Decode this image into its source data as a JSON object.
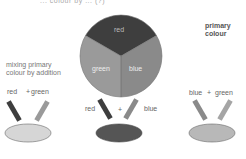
{
  "caption_top": "... colour by ... (?)",
  "wheel": {
    "segments": [
      {
        "label": "red",
        "color": "#3e3e3e"
      },
      {
        "label": "green",
        "color": "#9a9a9a"
      },
      {
        "label": "blue",
        "color": "#8a8a8a"
      }
    ]
  },
  "title_left": "mixing primary colour by addition",
  "title_right": "primary colour",
  "mixes": [
    {
      "label_a": "red",
      "plus": "+",
      "label_b": "green",
      "result_color": "#d4d4d4",
      "bar_a_color": "#3e3e3e",
      "bar_b_color": "#9a9a9a"
    },
    {
      "label_a": "red",
      "plus": "+",
      "label_b": "blue",
      "result_color": "#555555",
      "bar_a_color": "#3e3e3e",
      "bar_b_color": "#8a8a8a"
    },
    {
      "label_a": "blue",
      "plus": "+",
      "label_b": "green",
      "result_color": "#b8b8b8",
      "bar_a_color": "#8a8a8a",
      "bar_b_color": "#9a9a9a"
    }
  ]
}
